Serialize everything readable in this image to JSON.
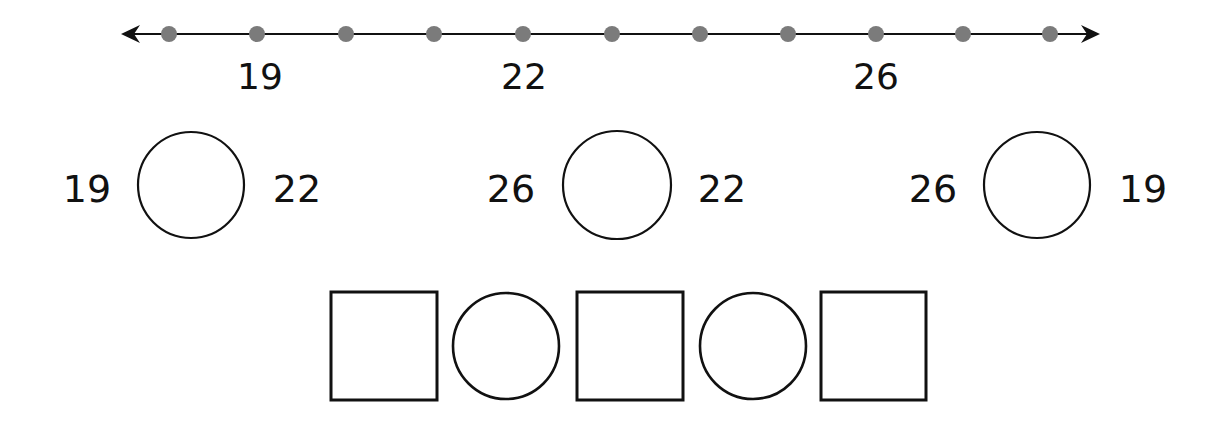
{
  "number_line": {
    "ticks": [
      {
        "value": 18,
        "x": 169,
        "label": null
      },
      {
        "value": 19,
        "x": 257,
        "label": "19"
      },
      {
        "value": 20,
        "x": 346,
        "label": null
      },
      {
        "value": 21,
        "x": 434,
        "label": null
      },
      {
        "value": 22,
        "x": 523,
        "label": "22"
      },
      {
        "value": 23,
        "x": 612,
        "label": null
      },
      {
        "value": 24,
        "x": 700,
        "label": null
      },
      {
        "value": 25,
        "x": 788,
        "label": null
      },
      {
        "value": 26,
        "x": 876,
        "label": "26"
      },
      {
        "value": 27,
        "x": 963,
        "label": null
      },
      {
        "value": 28,
        "x": 1050,
        "label": null
      }
    ],
    "labels": [
      "19",
      "22",
      "26"
    ],
    "line_color": "#111111",
    "dot_color": "#7b7b7b"
  },
  "comparisons": [
    {
      "left": "19",
      "right": "22"
    },
    {
      "left": "26",
      "right": "22"
    },
    {
      "left": "26",
      "right": "19"
    }
  ],
  "ordering_row": {
    "shapes": [
      "square",
      "circle",
      "square",
      "circle",
      "square"
    ]
  }
}
